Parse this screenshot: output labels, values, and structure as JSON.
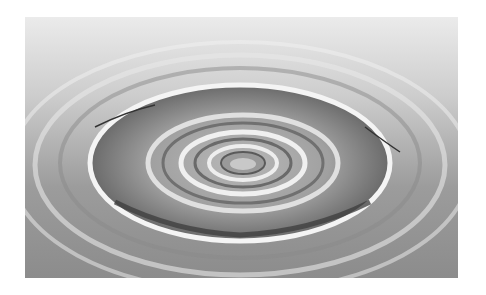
{
  "image": {
    "subject": "Concentric water ripples",
    "alt": "Grayscale photo of concentric ripples spreading across a water surface",
    "colors": {
      "background": "#ffffff",
      "light": "#e6e6e6",
      "mid": "#a8a8a8",
      "dark": "#4a4a4a"
    }
  }
}
